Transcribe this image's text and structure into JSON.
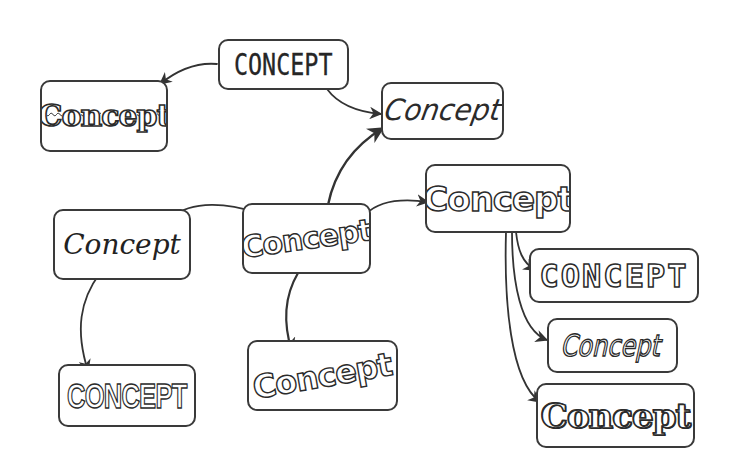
{
  "diagram": {
    "type": "concept-map",
    "stroke_color": "#3a3a3a",
    "background": "#ffffff",
    "nodes": [
      {
        "id": "n1",
        "label": "CONCEPT",
        "style": "geometric-thin-caps"
      },
      {
        "id": "n2",
        "label": "Concept",
        "style": "wavy-fuzzy"
      },
      {
        "id": "n3",
        "label": "Concept",
        "style": "angular-sharp"
      },
      {
        "id": "n4",
        "label": "Concept",
        "style": "rounded-bubble"
      },
      {
        "id": "n5",
        "label": "Concept",
        "style": "cursive-script"
      },
      {
        "id": "n6",
        "label": "Concept",
        "style": "arched-bubble"
      },
      {
        "id": "n7",
        "label": "CONCEPT",
        "style": "outlined-block-caps"
      },
      {
        "id": "n8",
        "label": "Concept",
        "style": "slanted-outline"
      },
      {
        "id": "n9",
        "label": "Concept",
        "style": "spiky-starburst"
      },
      {
        "id": "n10",
        "label": "CONCEPT",
        "style": "inline-striped-caps"
      },
      {
        "id": "n11",
        "label": "Concept",
        "style": "arched-outline"
      }
    ],
    "edges": [
      {
        "from": "n1",
        "to": "n2"
      },
      {
        "from": "n1",
        "to": "n3"
      },
      {
        "from": "n6",
        "to": "n3"
      },
      {
        "from": "n5",
        "to": "n6"
      },
      {
        "from": "n6",
        "to": "n4"
      },
      {
        "from": "n5",
        "to": "n10"
      },
      {
        "from": "n6",
        "to": "n11"
      },
      {
        "from": "n4",
        "to": "n7"
      },
      {
        "from": "n4",
        "to": "n8"
      },
      {
        "from": "n4",
        "to": "n9"
      }
    ]
  }
}
